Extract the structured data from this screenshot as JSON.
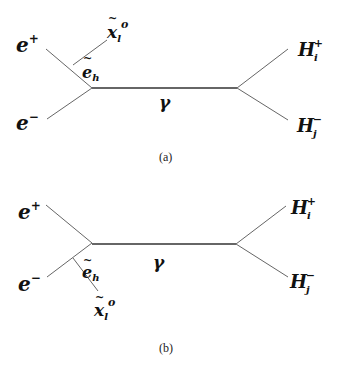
{
  "diagrams": [
    {
      "caption": "(a)",
      "labels": {
        "e_plus": "e",
        "e_plus_sup": "+",
        "e_minus": "e",
        "e_minus_sup": "−",
        "neutralino": "x",
        "neutralino_tilde": "~",
        "neutralino_sub": "l",
        "neutralino_sup": "o",
        "selectron": "e",
        "selectron_tilde": "~",
        "selectron_sub": "h",
        "photon": "γ",
        "h_plus": "H",
        "h_plus_sub": "i",
        "h_plus_sup": "+",
        "h_minus": "H",
        "h_minus_sub": "j",
        "h_minus_sup": "−"
      }
    },
    {
      "caption": "(b)",
      "labels": {
        "e_plus": "e",
        "e_plus_sup": "+",
        "e_minus": "e",
        "e_minus_sup": "−",
        "neutralino": "x",
        "neutralino_tilde": "~",
        "neutralino_sub": "l",
        "neutralino_sup": "o",
        "selectron": "e",
        "selectron_tilde": "~",
        "selectron_sub": "h",
        "photon": "γ",
        "h_plus": "H",
        "h_plus_sub": "i",
        "h_plus_sup": "+",
        "h_minus": "H",
        "h_minus_sub": "j",
        "h_minus_sup": "−"
      }
    }
  ]
}
